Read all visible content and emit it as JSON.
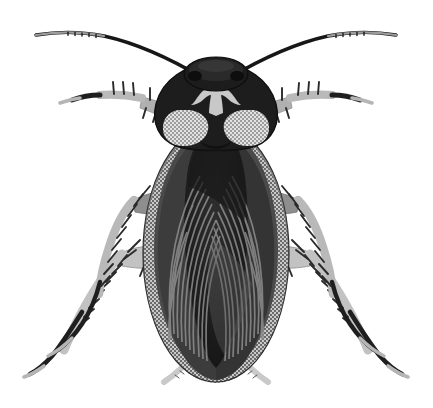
{
  "illustration": {
    "title": "Cockroach",
    "subject_common_name": "Cockroach",
    "view": "dorsal (top-down)",
    "style": "grayscale halftone scientific illustration",
    "background_color": "#ffffff",
    "canvas": {
      "width": 433,
      "height": 408
    }
  },
  "palette": {
    "background": "#ffffff",
    "body_darkest": "#151515",
    "body_dark": "#262626",
    "body_mid_dark": "#3a3a3a",
    "body_mid": "#555555",
    "wing_stripe": "#6e6e6e",
    "halftone_gray": "#8a8a8a",
    "leg_light": "#b9b9b9",
    "leg_lighter": "#cfcfcf",
    "marking_light": "#c8c8c8",
    "antenna_dark": "#1a1a1a",
    "antenna_tip": "#9a9a9a",
    "outline": "#101010"
  },
  "anatomy": {
    "parts": [
      {
        "name": "antenna-left",
        "label": "Left antenna",
        "count": 1,
        "color": "#1a1a1a",
        "tip_color": "#9a9a9a"
      },
      {
        "name": "antenna-right",
        "label": "Right antenna",
        "count": 1,
        "color": "#1a1a1a",
        "tip_color": "#9a9a9a"
      },
      {
        "name": "head-capsule",
        "label": "Head capsule",
        "count": 1,
        "color": "#1d1d1d"
      },
      {
        "name": "pronotum",
        "label": "Pronotum (thoracic shield)",
        "count": 1,
        "color": "#222222"
      },
      {
        "name": "pronotum-marking-center",
        "label": "Central pale butterfly marking",
        "count": 1,
        "color": "#c8c8c8"
      },
      {
        "name": "pronotum-marking-lobe-left",
        "label": "Left pale lobe",
        "count": 1,
        "color": "#cfcfcf"
      },
      {
        "name": "pronotum-marking-lobe-right",
        "label": "Right pale lobe",
        "count": 1,
        "color": "#cfcfcf"
      },
      {
        "name": "tegmen-left",
        "label": "Left forewing (tegmen)",
        "count": 1,
        "color": "#3a3a3a"
      },
      {
        "name": "tegmen-right",
        "label": "Right forewing (tegmen)",
        "count": 1,
        "color": "#3a3a3a"
      },
      {
        "name": "abdomen",
        "label": "Abdomen",
        "count": 1,
        "color": "#262626"
      },
      {
        "name": "cercus-left",
        "label": "Left cercus",
        "count": 1,
        "color": "#d0d0d0"
      },
      {
        "name": "cercus-right",
        "label": "Right cercus",
        "count": 1,
        "color": "#d0d0d0"
      },
      {
        "name": "foreleg-left",
        "label": "Left foreleg",
        "count": 1,
        "color": "#b9b9b9"
      },
      {
        "name": "foreleg-right",
        "label": "Right foreleg",
        "count": 1,
        "color": "#b9b9b9"
      },
      {
        "name": "midleg-left",
        "label": "Left middle leg",
        "count": 1,
        "color": "#b9b9b9"
      },
      {
        "name": "midleg-right",
        "label": "Right middle leg",
        "count": 1,
        "color": "#b9b9b9"
      },
      {
        "name": "hindleg-left",
        "label": "Left hind leg",
        "count": 1,
        "color": "#c2c2c2"
      },
      {
        "name": "hindleg-right",
        "label": "Right hind leg",
        "count": 1,
        "color": "#c2c2c2"
      }
    ],
    "leg_count": 6,
    "antenna_count": 2,
    "cercus_count": 2
  }
}
